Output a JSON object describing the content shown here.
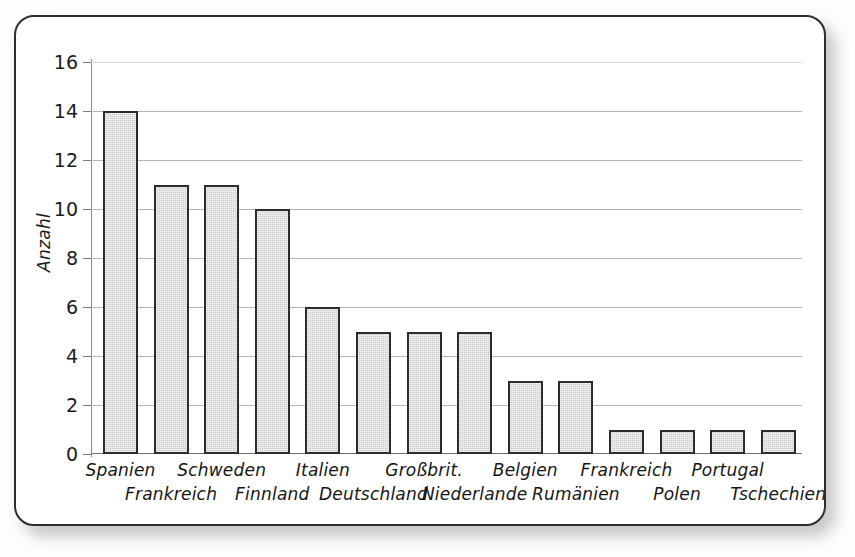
{
  "chart_data": {
    "type": "bar",
    "title": "",
    "subtitle": "",
    "xlabel": "",
    "ylabel": "Anzahl",
    "ylim": [
      0,
      16
    ],
    "ytick_step": 2,
    "yticks": [
      "16",
      "14",
      "12",
      "10",
      "8",
      "6",
      "4",
      "2",
      "0"
    ],
    "grid": true,
    "legend": "none",
    "bar_fill_color": "#c9c9c9",
    "bar_border_color": "#2b2b2b",
    "categories": [
      "Spanien",
      "Frankreich",
      "Schweden",
      "Finnland",
      "Italien",
      "Deutschland",
      "Großbrit.",
      "Niederlande",
      "Belgien",
      "Rumänien",
      "Frankreich",
      "Polen",
      "Portugal",
      "Tschechien"
    ],
    "values": [
      14,
      11,
      11,
      10,
      6,
      5,
      5,
      5,
      3,
      3,
      1,
      1,
      1,
      1
    ],
    "label_rows": [
      1,
      2,
      1,
      2,
      1,
      2,
      1,
      2,
      1,
      2,
      1,
      2,
      1,
      2
    ]
  }
}
